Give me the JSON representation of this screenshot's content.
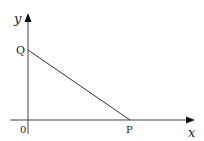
{
  "diagram": {
    "axes": {
      "x_label": "x",
      "y_label": "y",
      "origin_label": "0"
    },
    "points": [
      {
        "name": "Q",
        "label": "Q",
        "location": "on y-axis"
      },
      {
        "name": "P",
        "label": "P",
        "location": "on x-axis"
      }
    ],
    "segments": [
      {
        "from": "Q",
        "to": "P"
      }
    ],
    "colors": {
      "line": "#333333",
      "background": "#ffffff"
    }
  }
}
